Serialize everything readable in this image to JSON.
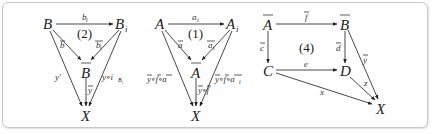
{
  "figure": {
    "diagrams": [
      {
        "id": "diagram-2",
        "region_label": "(2)",
        "nodes": {
          "B": "B",
          "B_i": "B",
          "B_i_sub": "i",
          "B_bar": "B",
          "X": "X"
        },
        "edges": {
          "top": "b",
          "top_sub": "i",
          "left_diag": "b",
          "right_diag": "b",
          "right_diag_sub": "i",
          "left_long": "y'",
          "right_long": "y∘i",
          "right_long_sub": "B",
          "right_long_subsub": "i",
          "vertical": "y"
        }
      },
      {
        "id": "diagram-1",
        "region_label": "(1)",
        "nodes": {
          "A": "A",
          "A_i": "A",
          "A_i_sub": "i",
          "A_bar": "A",
          "X": "X"
        },
        "edges": {
          "top": "a",
          "top_sub": "i",
          "left_diag": "a",
          "right_diag": "a",
          "right_diag_sub": "i",
          "left_long": "y∘f∘a",
          "right_long": "y∘f∘a",
          "right_long_sub": "i",
          "vertical": "y∘f"
        }
      },
      {
        "id": "diagram-4",
        "region_label": "(4)",
        "nodes": {
          "A_bar": "A",
          "B_bar": "B",
          "C": "C",
          "D": "D",
          "X": "X"
        },
        "edges": {
          "top": "f",
          "left": "c",
          "right": "d",
          "middle": "e",
          "B_to_X": "y",
          "D_to_X": "z",
          "C_to_X": "x"
        }
      }
    ],
    "colors": {
      "frame_border": "#c8c8c8",
      "ink": "#222222",
      "background": "#ffffff"
    }
  }
}
